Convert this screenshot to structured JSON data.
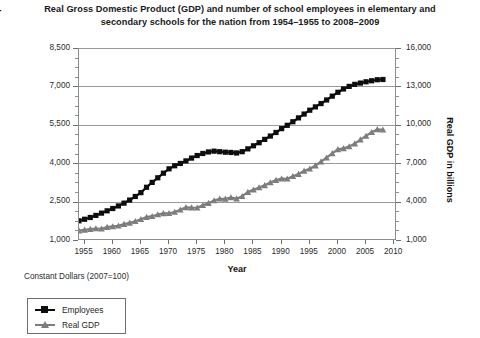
{
  "chart_data": {
    "type": "line",
    "title": "Real Gross Domestic Product (GDP) and number of school employees in elementary and secondary schools for the nation from 1954–1955 to 2008–2009",
    "xlabel": "Year",
    "ylabel_left": "Number of employees in thousands",
    "ylabel_right": "Real GDP in billions",
    "footnote": "Constant Dollars (2007=100)",
    "grid": true,
    "legend_position": "below-left",
    "xlim": [
      1954,
      2010.5
    ],
    "xticks": [
      1955,
      1960,
      1965,
      1970,
      1975,
      1980,
      1985,
      1990,
      1995,
      2000,
      2005,
      2010
    ],
    "ylim_left": [
      1000,
      8500
    ],
    "yticks_left": [
      1000,
      2500,
      4000,
      5500,
      7000,
      8500
    ],
    "yticks_left_minor_step": 375,
    "ylim_right": [
      1000,
      16000
    ],
    "yticks_right": [
      1000,
      4000,
      7000,
      10000,
      13000,
      16000
    ],
    "yticks_right_minor_step": 750,
    "colors": {
      "employees": "#0d0d0d",
      "real_gdp": "#7d7d7d",
      "grid": "#9a9a9a",
      "axis": "#8d8d8d"
    },
    "x": [
      1954,
      1955,
      1956,
      1957,
      1958,
      1959,
      1960,
      1961,
      1962,
      1963,
      1964,
      1965,
      1966,
      1967,
      1968,
      1969,
      1970,
      1971,
      1972,
      1973,
      1974,
      1975,
      1976,
      1977,
      1978,
      1979,
      1980,
      1981,
      1982,
      1983,
      1984,
      1985,
      1986,
      1987,
      1988,
      1989,
      1990,
      1991,
      1992,
      1993,
      1994,
      1995,
      1996,
      1997,
      1998,
      1999,
      2000,
      2001,
      2002,
      2003,
      2004,
      2005,
      2006,
      2007,
      2008
    ],
    "series": [
      {
        "name": "Employees",
        "axis": "left",
        "marker": "square",
        "color": "#0d0d0d",
        "unit": "thousands",
        "values": [
          1750,
          1810,
          1880,
          1960,
          2050,
          2140,
          2230,
          2330,
          2440,
          2560,
          2700,
          2850,
          3060,
          3250,
          3430,
          3610,
          3780,
          3900,
          3990,
          4090,
          4200,
          4300,
          4380,
          4440,
          4470,
          4450,
          4430,
          4420,
          4400,
          4450,
          4560,
          4680,
          4800,
          4930,
          5060,
          5200,
          5350,
          5480,
          5620,
          5770,
          5920,
          6070,
          6200,
          6330,
          6470,
          6620,
          6770,
          6900,
          7000,
          7080,
          7130,
          7180,
          7220,
          7260,
          7270
        ]
      },
      {
        "name": "Real GDP",
        "axis": "right",
        "marker": "triangle",
        "color": "#7d7d7d",
        "unit": "billions",
        "values": [
          1730,
          1790,
          1850,
          1900,
          1880,
          2010,
          2060,
          2110,
          2240,
          2340,
          2470,
          2620,
          2790,
          2860,
          2990,
          3080,
          3090,
          3190,
          3360,
          3550,
          3530,
          3520,
          3710,
          3880,
          4090,
          4220,
          4210,
          4320,
          4230,
          4420,
          4740,
          4930,
          5100,
          5270,
          5490,
          5680,
          5790,
          5780,
          5980,
          6150,
          6400,
          6570,
          6810,
          7120,
          7430,
          7770,
          8080,
          8160,
          8300,
          8530,
          8840,
          9130,
          9420,
          9640,
          9610
        ]
      }
    ]
  },
  "legend": {
    "items": [
      {
        "label": "Employees",
        "marker": "square",
        "color": "#0d0d0d"
      },
      {
        "label": "Real GDP",
        "marker": "triangle",
        "color": "#7d7d7d"
      }
    ]
  }
}
